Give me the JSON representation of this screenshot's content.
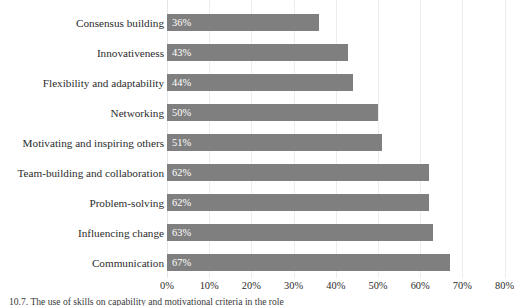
{
  "chart_data": {
    "type": "bar",
    "orientation": "horizontal",
    "title": "",
    "subtitle": "",
    "xlabel": "",
    "ylabel": "",
    "categories": [
      "Consensus building",
      "Innovativeness",
      "Flexibility and adaptability",
      "Networking",
      "Motivating and inspiring others",
      "Team-building and collaboration",
      "Problem-solving",
      "Influencing change",
      "Communication"
    ],
    "values": [
      36,
      43,
      44,
      50,
      51,
      62,
      62,
      63,
      67
    ],
    "value_labels": [
      "36%",
      "43%",
      "44%",
      "50%",
      "51%",
      "62%",
      "62%",
      "63%",
      "67%"
    ],
    "xlim": [
      0,
      80
    ],
    "xticks": [
      0,
      10,
      20,
      30,
      40,
      50,
      60,
      70,
      80
    ],
    "xticklabels": [
      "0%",
      "10%",
      "20%",
      "30%",
      "40%",
      "50%",
      "60%",
      "70%",
      "80%"
    ],
    "grid": "vertical",
    "legend": "none",
    "bar_color": "#7f7f7f",
    "gridline_color": "#eceded",
    "value_label_color": "#ffffff",
    "background_color": "#ffffff"
  },
  "caption": {
    "text": "10.7. The use of skills on capability and motivational criteria in the role"
  }
}
